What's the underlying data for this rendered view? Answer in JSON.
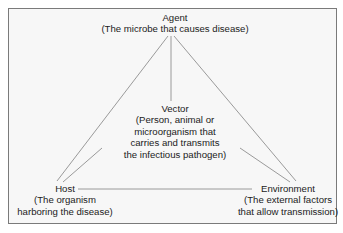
{
  "diagram": {
    "type": "epidemiologic triad",
    "nodes": {
      "agent": {
        "title": "Agent",
        "desc": [
          "(The microbe that causes disease)"
        ]
      },
      "vector": {
        "title": "Vector",
        "desc": [
          "(Person, animal or",
          "microorganism that",
          "carries and transmits",
          "the infectious pathogen)"
        ]
      },
      "host": {
        "title": "Host",
        "desc": [
          "(The organism",
          "harboring the disease)"
        ]
      },
      "environment": {
        "title": "Environment",
        "desc": [
          "(The external factors",
          "that allow transmission)"
        ]
      }
    },
    "edges": [
      [
        "agent",
        "host"
      ],
      [
        "agent",
        "vector"
      ],
      [
        "agent",
        "environment"
      ],
      [
        "vector",
        "host"
      ],
      [
        "vector",
        "environment"
      ],
      [
        "host",
        "environment"
      ]
    ],
    "colors": {
      "line": "#9a9a9a",
      "frame": "#7a7a7a",
      "background": "#f7f7f7",
      "text": "#222222"
    }
  }
}
